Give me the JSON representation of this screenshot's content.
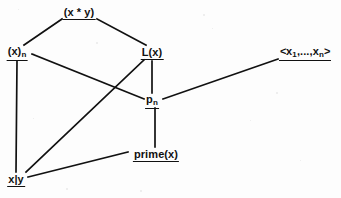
{
  "diagram": {
    "title_fragment_cut_off_at_top": "",
    "background_color": "#fdfdfd",
    "ink_color": "#111111",
    "nodes": [
      {
        "id": "product",
        "label": "(x * y)",
        "sub": "",
        "x": 79,
        "y": 13
      },
      {
        "id": "x-sub-n",
        "label": "(x)",
        "sub": "n",
        "x": 17,
        "y": 53
      },
      {
        "id": "l-of-x",
        "label": "L(x)",
        "sub": "",
        "x": 152,
        "y": 53
      },
      {
        "id": "sequence",
        "label": "<x",
        "sub": "",
        "x": 305,
        "y": 53
      },
      {
        "id": "p-sub-n",
        "label": "p",
        "sub": "n",
        "x": 152,
        "y": 101
      },
      {
        "id": "prime",
        "label": "prime(x)",
        "sub": "",
        "x": 156,
        "y": 155
      },
      {
        "id": "divides",
        "label": "x|y",
        "sub": "",
        "x": 16,
        "y": 180
      }
    ],
    "sequence_node": {
      "open": "<",
      "var1": "x",
      "sub1": "1",
      "ellipsis": ",...,",
      "var2": "x",
      "sub2": "n",
      "close": ">"
    },
    "edges": [
      {
        "from": "product",
        "to": "x-sub-n",
        "x1": 62,
        "y1": 19,
        "x2": 24,
        "y2": 45
      },
      {
        "from": "product",
        "to": "l-of-x",
        "x1": 97,
        "y1": 19,
        "x2": 146,
        "y2": 45
      },
      {
        "from": "x-sub-n",
        "to": "p-sub-n",
        "x1": 32,
        "y1": 54,
        "x2": 144,
        "y2": 99
      },
      {
        "from": "x-sub-n",
        "to": "divides",
        "x1": 17,
        "y1": 61,
        "x2": 16,
        "y2": 172
      },
      {
        "from": "l-of-x",
        "to": "p-sub-n",
        "x1": 152,
        "y1": 61,
        "x2": 152,
        "y2": 93
      },
      {
        "from": "l-of-x",
        "to": "divides",
        "x1": 144,
        "y1": 60,
        "x2": 26,
        "y2": 172
      },
      {
        "from": "p-sub-n",
        "to": "prime",
        "x1": 155,
        "y1": 108,
        "x2": 155,
        "y2": 147
      },
      {
        "from": "p-sub-n",
        "to": "sequence",
        "x1": 163,
        "y1": 99,
        "x2": 278,
        "y2": 59
      },
      {
        "from": "prime",
        "to": "divides",
        "x1": 128,
        "y1": 152,
        "x2": 28,
        "y2": 177
      }
    ]
  }
}
